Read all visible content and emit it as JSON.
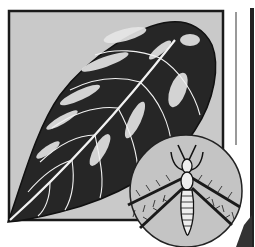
{
  "illustration": {
    "subject": "leaf damaged by thrips with magnified insect inset",
    "panel": {
      "background": "#c9c9c9",
      "border": "#1a1a1a"
    },
    "leaf": {
      "fill": "#222222",
      "highlight": "#e8e8e8",
      "vein": "#f2f2f2"
    },
    "inset": {
      "shape": "circle",
      "background": "#c4c4c4",
      "border": "#222222",
      "subject": "thrips insect"
    },
    "insect": {
      "body": "#eeeeee",
      "outline": "#111111",
      "wing": "#2a2a2a"
    }
  }
}
